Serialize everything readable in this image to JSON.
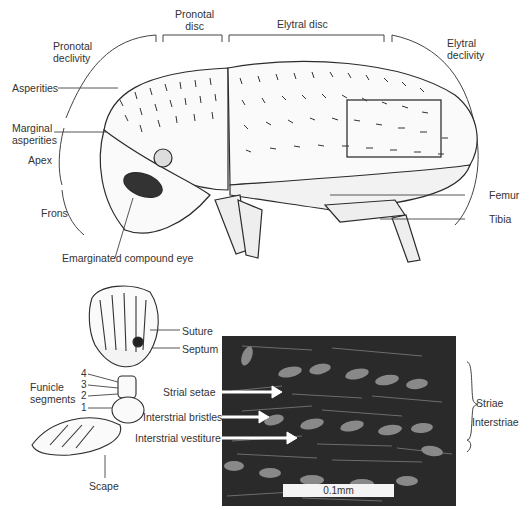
{
  "figure": {
    "beetle_labels": {
      "pronotal_disc": "Pronotal\ndisc",
      "pronotal_disc_l1": "Pronotal",
      "pronotal_disc_l2": "disc",
      "elytral_disc": "Elytral disc",
      "pronotal_declivity_l1": "Pronotal",
      "pronotal_declivity_l2": "declivity",
      "elytral_declivity_l1": "Elytral",
      "elytral_declivity_l2": "declivity",
      "asperities": "Asperities",
      "marginal_asperities_l1": "Marginal",
      "marginal_asperities_l2": "asperities",
      "apex": "Apex",
      "frons": "Frons",
      "eye": "Emarginated compound eye",
      "femur": "Femur",
      "tibia": "Tibia"
    },
    "antenna_labels": {
      "suture": "Suture",
      "septum": "Septum",
      "funicle_l1": "Funicle",
      "funicle_l2": "segments",
      "seg4": "4",
      "seg3": "3",
      "seg2": "2",
      "seg1": "1",
      "scape": "Scape"
    },
    "sem_labels": {
      "strial_setae": "Strial setae",
      "interstrial_bristles": "Interstrial bristles",
      "interstrial_vestiture": "Interstrial vestiture",
      "striae": "Striae",
      "interstriae": "Interstriae",
      "scale_bar": "0.1mm"
    },
    "colors": {
      "line": "#333333",
      "sem_background": "#2b2b2b",
      "arrow": "#ffffff"
    }
  }
}
